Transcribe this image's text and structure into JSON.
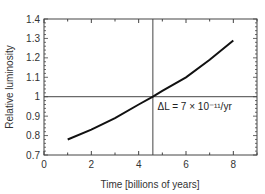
{
  "chart_data": {
    "type": "line",
    "title": "",
    "xlabel": "Time [billions of years]",
    "ylabel": "Relative luminosity",
    "xlim": [
      0,
      9
    ],
    "ylim": [
      0.7,
      1.4
    ],
    "xticks": [
      0,
      2,
      4,
      6,
      8
    ],
    "xtick_labels": [
      "0",
      "2",
      "4",
      "6",
      "8"
    ],
    "yticks": [
      0.7,
      0.8,
      0.9,
      1.0,
      1.1,
      1.2,
      1.3,
      1.4
    ],
    "ytick_labels": [
      "0.7",
      "0.8",
      "0.9",
      "1",
      "1.1",
      "1.2",
      "1.3",
      "1.4"
    ],
    "grid": false,
    "series": [
      {
        "name": "Relative luminosity",
        "x": [
          1,
          2,
          3,
          4,
          4.6,
          5,
          6,
          7,
          8
        ],
        "values": [
          0.78,
          0.83,
          0.89,
          0.96,
          1.0,
          1.03,
          1.1,
          1.19,
          1.29
        ]
      }
    ],
    "reference_lines": {
      "vertical_x": 4.6,
      "horizontal_y": 1.0
    },
    "annotations": [
      {
        "text": "ΔL = 7 × 10⁻¹¹/yr",
        "x": 4.8,
        "y": 0.93
      }
    ]
  }
}
